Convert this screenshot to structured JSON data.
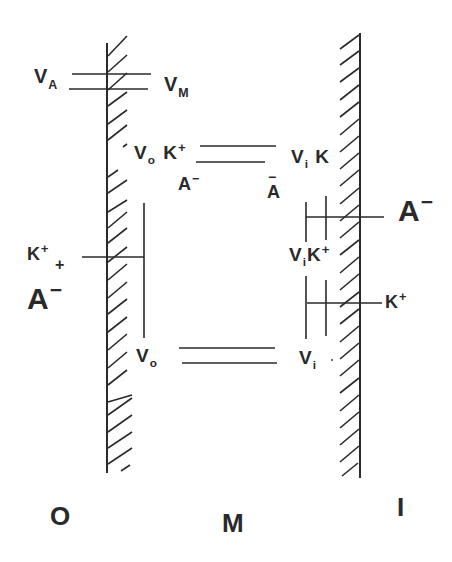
{
  "diagram": {
    "colors": {
      "ink": "#2a2a2a",
      "background": "#ffffff"
    },
    "compartments": {
      "outer": "O",
      "membrane": "M",
      "inner": "I"
    },
    "labels": {
      "va": {
        "base": "V",
        "sub": "A"
      },
      "vm": {
        "base": "V",
        "sub": "M"
      },
      "vo_k_top": {
        "base": "V",
        "sub": "o",
        "ion": "K",
        "charge": "+"
      },
      "a_minus_left_mid": {
        "base": "A",
        "charge": "−"
      },
      "vi_k_top": {
        "base": "V",
        "sub": "i",
        "ion": "K"
      },
      "a_minus_right_mid": {
        "base": "A",
        "charge": "−"
      },
      "k_plus_outer": {
        "base": "K",
        "charge": "+",
        "extra": "+"
      },
      "a_minus_outer": {
        "base": "A",
        "charge": "−"
      },
      "a_minus_inner": {
        "base": "A",
        "charge": "−"
      },
      "vi_k_plus": {
        "base": "V",
        "sub": "i",
        "ion": "K",
        "charge": "+"
      },
      "k_plus_inner": {
        "base": "K",
        "charge": "+"
      },
      "vo_bottom": {
        "base": "V",
        "sub": "o"
      },
      "vi_bottom": {
        "base": "V",
        "sub": "i"
      }
    }
  }
}
